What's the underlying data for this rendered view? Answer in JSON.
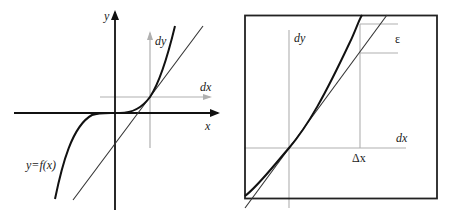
{
  "figure": {
    "left_panel": {
      "axis_x_label": "x",
      "axis_y_label": "y",
      "local_dx_label": "dx",
      "local_dy_label": "dy",
      "curve_label": "y=f(x)"
    },
    "right_panel": {
      "local_dx_label": "dx",
      "local_dy_label": "dy",
      "delta_x_label": "Δx",
      "epsilon_label": "ε"
    }
  },
  "colors": {
    "ink": "#111111",
    "gray_axis": "#b0b0b0",
    "tangent": "#333333"
  }
}
